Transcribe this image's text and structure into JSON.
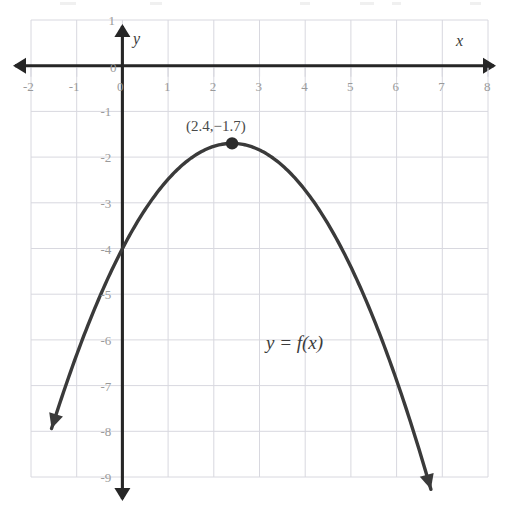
{
  "chart_data": {
    "type": "line",
    "title": "",
    "subtitle": "",
    "xlabel": "x",
    "ylabel": "y",
    "xlim": [
      -2,
      8
    ],
    "ylim": [
      -9,
      1
    ],
    "xticks": [
      "-2",
      "-1",
      "0",
      "1",
      "2",
      "3",
      "4",
      "5",
      "6",
      "7",
      "8"
    ],
    "yticks": [
      "1",
      "0",
      "-1",
      "-2",
      "-3",
      "-4",
      "-5",
      "-6",
      "-7",
      "-8",
      "-9"
    ],
    "grid": true,
    "grid_step": 1,
    "legend": "none",
    "series": [
      {
        "name": "y = f(x)",
        "kind": "parabola",
        "vertex": [
          2.4,
          -1.7
        ],
        "leading_coefficient": -0.4,
        "equation": "f(x) = -0.4(x - 2.4)^2 - 1.7",
        "x_domain": [
          -1.55,
          6.75
        ],
        "arrow_start": true,
        "arrow_end": true,
        "points": [
          [
            -1.55,
            -8.98
          ],
          [
            -1.25,
            -7.99
          ],
          [
            -1.0,
            -7.02
          ],
          [
            -0.75,
            -6.67
          ],
          [
            -0.5,
            -5.06
          ],
          [
            -0.25,
            -4.52
          ],
          [
            0.0,
            -4.0
          ],
          [
            0.5,
            -3.15
          ],
          [
            1.0,
            -2.48
          ],
          [
            1.5,
            -2.02
          ],
          [
            2.0,
            -1.76
          ],
          [
            2.4,
            -1.7
          ],
          [
            2.8,
            -1.76
          ],
          [
            3.3,
            -2.02
          ],
          [
            3.8,
            -2.48
          ],
          [
            4.3,
            -3.14
          ],
          [
            4.8,
            -4.0
          ],
          [
            5.3,
            -5.06
          ],
          [
            5.8,
            -6.32
          ],
          [
            6.3,
            -7.78
          ],
          [
            6.75,
            -9.0
          ]
        ]
      }
    ],
    "annotations": [
      {
        "name": "vertex-label",
        "text": "(2.4,−1.7)",
        "x": 2.4,
        "y": -1.0
      },
      {
        "name": "function-label",
        "text": "y = f(x)",
        "x": 4.0,
        "y": -5.5
      },
      {
        "name": "origin-label",
        "text": "0",
        "x": 0,
        "y": 0
      }
    ],
    "markers": [
      {
        "name": "vertex-point",
        "x": 2.4,
        "y": -1.7,
        "style": "filled-circle",
        "color": "#2b2b2b"
      }
    ],
    "colors": {
      "curve": "#3a3a3a",
      "axis": "#262626",
      "grid": "#d8d8df",
      "tick_label": "#9a9a9a",
      "annotation": "#4a4a4a",
      "background": "#ffffff"
    }
  },
  "axis_names": {
    "x": "x",
    "y": "y"
  },
  "origin_labels": {
    "on_y_axis": "0",
    "below_x_axis": "0"
  }
}
